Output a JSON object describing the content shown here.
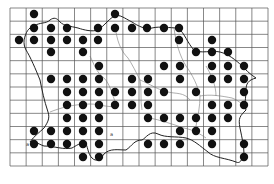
{
  "map": {
    "type": "distribution-grid-map",
    "background": "#ffffff",
    "line_color": "#555555",
    "coast_color": "#222222",
    "dot_color": "#111111",
    "grid": {
      "left": 10,
      "top": 8,
      "right": 268,
      "bottom": 166,
      "columns": 16,
      "rows": 12
    },
    "labels": [
      "a",
      "a"
    ],
    "records": [
      [
        34,
        14
      ],
      [
        115,
        14
      ],
      [
        34,
        28
      ],
      [
        51,
        28
      ],
      [
        67,
        28
      ],
      [
        98,
        28
      ],
      [
        115,
        28
      ],
      [
        132,
        28
      ],
      [
        147,
        28
      ],
      [
        164,
        28
      ],
      [
        179,
        28
      ],
      [
        19,
        40
      ],
      [
        34,
        40
      ],
      [
        51,
        40
      ],
      [
        67,
        40
      ],
      [
        83,
        40
      ],
      [
        98,
        40
      ],
      [
        179,
        40
      ],
      [
        212,
        40
      ],
      [
        51,
        52
      ],
      [
        83,
        52
      ],
      [
        196,
        52
      ],
      [
        212,
        52
      ],
      [
        228,
        52
      ],
      [
        99,
        66
      ],
      [
        164,
        66
      ],
      [
        180,
        66
      ],
      [
        212,
        66
      ],
      [
        228,
        66
      ],
      [
        244,
        66
      ],
      [
        51,
        79
      ],
      [
        67,
        79
      ],
      [
        83,
        79
      ],
      [
        99,
        79
      ],
      [
        132,
        79
      ],
      [
        148,
        79
      ],
      [
        180,
        79
      ],
      [
        212,
        79
      ],
      [
        228,
        79
      ],
      [
        244,
        79
      ],
      [
        67,
        92
      ],
      [
        83,
        92
      ],
      [
        99,
        92
      ],
      [
        115,
        92
      ],
      [
        132,
        92
      ],
      [
        148,
        92
      ],
      [
        164,
        92
      ],
      [
        196,
        92
      ],
      [
        244,
        92
      ],
      [
        67,
        105
      ],
      [
        83,
        105
      ],
      [
        99,
        105
      ],
      [
        115,
        105
      ],
      [
        132,
        105
      ],
      [
        148,
        105
      ],
      [
        212,
        105
      ],
      [
        228,
        105
      ],
      [
        244,
        105
      ],
      [
        67,
        118
      ],
      [
        83,
        118
      ],
      [
        99,
        118
      ],
      [
        148,
        118
      ],
      [
        164,
        118
      ],
      [
        180,
        118
      ],
      [
        196,
        118
      ],
      [
        212,
        118
      ],
      [
        228,
        118
      ],
      [
        34,
        131
      ],
      [
        51,
        131
      ],
      [
        67,
        131
      ],
      [
        83,
        131
      ],
      [
        99,
        131
      ],
      [
        180,
        131
      ],
      [
        196,
        131
      ],
      [
        212,
        131
      ],
      [
        34,
        144
      ],
      [
        51,
        144
      ],
      [
        67,
        144
      ],
      [
        83,
        144
      ],
      [
        99,
        144
      ],
      [
        148,
        144
      ],
      [
        164,
        144
      ],
      [
        180,
        144
      ],
      [
        212,
        144
      ],
      [
        244,
        144
      ],
      [
        83,
        157
      ],
      [
        99,
        157
      ],
      [
        244,
        157
      ]
    ]
  }
}
